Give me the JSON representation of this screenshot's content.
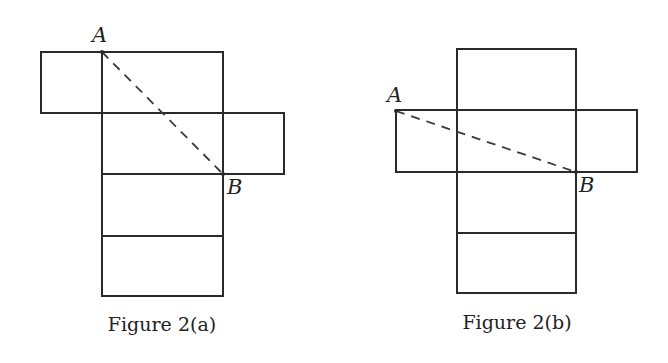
{
  "figures": [
    {
      "id": "a",
      "caption": "Figure 2(a)",
      "point_a_label": "A",
      "point_b_label": "B",
      "description": "Unfolded box net: left flap attached at top-left, right flap attached at middle-right, straight dashed path from A to B"
    },
    {
      "id": "b",
      "caption": "Figure 2(b)",
      "point_a_label": "A",
      "point_b_label": "B",
      "description": "Unfolded box net: left and right flaps both attached to the second row, straight dashed path from A to B"
    }
  ],
  "colors": {
    "stroke": "#2a2a2a",
    "background": "#ffffff"
  }
}
